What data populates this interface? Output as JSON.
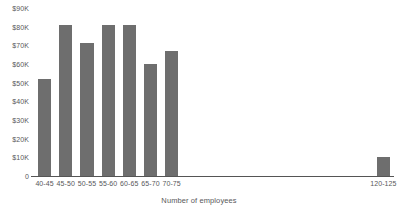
{
  "chart_data": {
    "type": "bar",
    "title": "",
    "subtitle": "",
    "xlabel": "Number of employees",
    "ylabel": "",
    "categories": [
      "40-45",
      "45-50",
      "50-55",
      "55-60",
      "60-65",
      "65-70",
      "70-75",
      "120-125"
    ],
    "values": [
      52000,
      81000,
      71000,
      81000,
      81000,
      60000,
      67000,
      10000
    ],
    "ylim": [
      0,
      90000
    ],
    "ytick_values": [
      0,
      10000,
      20000,
      30000,
      40000,
      50000,
      60000,
      70000,
      80000,
      90000
    ],
    "ytick_labels": [
      "0",
      "$10K",
      "$20K",
      "$30K",
      "$40K",
      "$50K",
      "$60K",
      "$70K",
      "$80K",
      "$90K"
    ],
    "grid": false,
    "legend": null,
    "bar_color": "#6e6e6e",
    "axis_color": "#555555",
    "text_color": "#58585a",
    "background": "#ffffff",
    "annotations": []
  }
}
